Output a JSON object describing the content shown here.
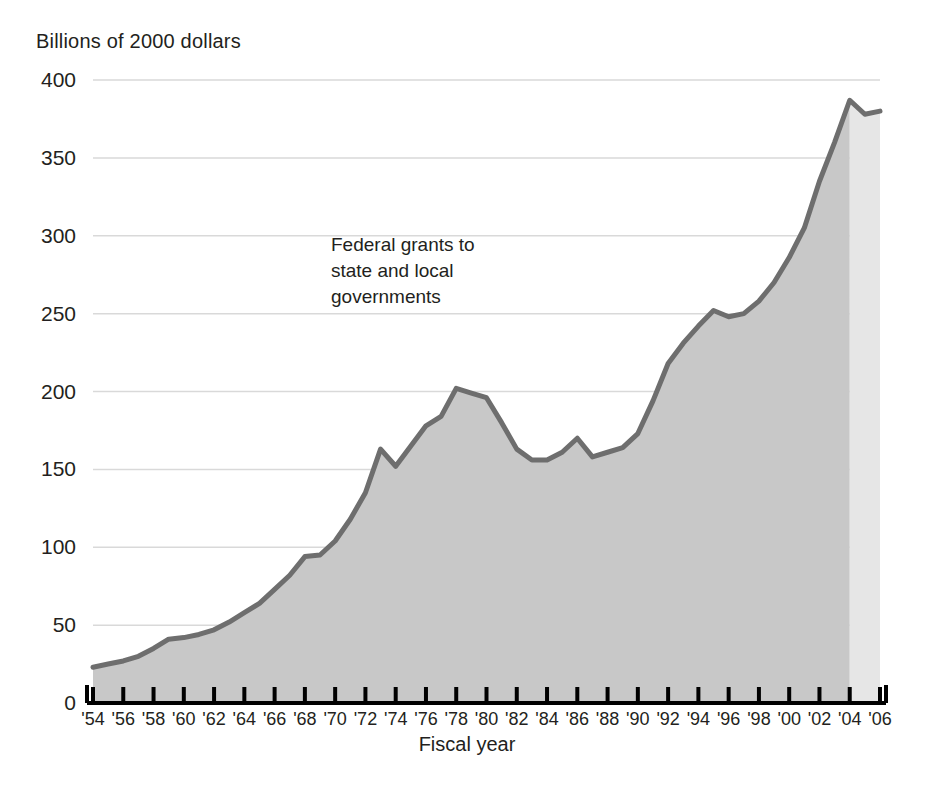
{
  "chart_data": {
    "type": "area",
    "title": "",
    "ylabel": "Billions of 2000 dollars",
    "xlabel": "Fiscal year",
    "series_label": "Federal grants to\nstate and local\ngovernments",
    "ylim": [
      0,
      400
    ],
    "ytick_values": [
      0,
      50,
      100,
      150,
      200,
      250,
      300,
      350,
      400
    ],
    "ytick_labels": [
      "0",
      "50",
      "100",
      "150",
      "200",
      "250",
      "300",
      "350",
      "400"
    ],
    "xlim": [
      1954,
      2006
    ],
    "xtick_values": [
      1954,
      1956,
      1958,
      1960,
      1962,
      1964,
      1966,
      1968,
      1970,
      1972,
      1974,
      1976,
      1978,
      1980,
      1982,
      1984,
      1986,
      1988,
      1990,
      1992,
      1994,
      1996,
      1998,
      2000,
      2002,
      2004,
      2006
    ],
    "xtick_labels": [
      "'54",
      "'56",
      "'58",
      "'60",
      "'62",
      "'64",
      "'66",
      "'68",
      "'70",
      "'72",
      "'74",
      "'76",
      "'78",
      "'80",
      "'82",
      "'84",
      "'86",
      "'88",
      "'90",
      "'92",
      "'94",
      "'96",
      "'98",
      "'00",
      "'02",
      "'04",
      "'06"
    ],
    "grid": "horizontal",
    "legend": "none",
    "projection_start_year": 2004,
    "x": [
      1954,
      1955,
      1956,
      1957,
      1958,
      1959,
      1960,
      1961,
      1962,
      1963,
      1964,
      1965,
      1966,
      1967,
      1968,
      1969,
      1970,
      1971,
      1972,
      1973,
      1974,
      1975,
      1976,
      1977,
      1978,
      1979,
      1980,
      1981,
      1982,
      1983,
      1984,
      1985,
      1986,
      1987,
      1988,
      1989,
      1990,
      1991,
      1992,
      1993,
      1994,
      1995,
      1996,
      1997,
      1998,
      1999,
      2000,
      2001,
      2002,
      2003,
      2004,
      2005,
      2006
    ],
    "values": [
      23,
      25,
      27,
      30,
      35,
      41,
      42,
      44,
      47,
      52,
      58,
      64,
      73,
      82,
      94,
      95,
      104,
      118,
      135,
      163,
      152,
      165,
      178,
      184,
      202,
      199,
      196,
      180,
      163,
      156,
      156,
      161,
      170,
      158,
      161,
      164,
      173,
      194,
      218,
      231,
      242,
      252,
      248,
      250,
      258,
      270,
      286,
      305,
      335,
      360,
      387,
      378,
      380
    ],
    "colors": {
      "line": "#6e6e6e",
      "fill_actual": "#c8c8c8",
      "fill_projection": "#e6e6e6",
      "grid": "#d9d9d9",
      "axis": "#000000",
      "text": "#231f20"
    }
  }
}
